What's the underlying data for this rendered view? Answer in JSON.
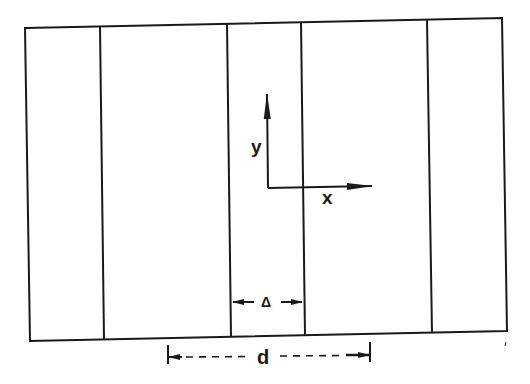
{
  "figure": {
    "type": "schematic",
    "colors": {
      "ink": "#1a1a1a",
      "background": "#ffffff"
    },
    "outer_frame": {
      "top_left": [
        25,
        28
      ],
      "top_right": [
        502,
        18
      ],
      "bottom_right": [
        507,
        331
      ],
      "bottom_left": [
        30,
        341
      ]
    },
    "dividers": [
      {
        "top": [
          100,
          27
        ],
        "bottom": [
          104,
          340
        ]
      },
      {
        "top": [
          227,
          24
        ],
        "bottom": [
          231,
          337
        ]
      },
      {
        "top": [
          301,
          22
        ],
        "bottom": [
          305,
          336
        ]
      },
      {
        "top": [
          427,
          20
        ],
        "bottom": [
          432,
          333
        ]
      }
    ],
    "axes": {
      "origin": [
        268,
        188
      ],
      "y_tip": [
        267,
        94
      ],
      "x_tip": [
        372,
        186
      ],
      "y_label": "y",
      "x_label": "x"
    },
    "dimensions": {
      "delta": {
        "label": "Δ",
        "left": 231,
        "right": 304,
        "y": 302
      },
      "d": {
        "label": "d",
        "left": 168,
        "right": 370,
        "y": 356,
        "style": "dashed"
      }
    }
  }
}
